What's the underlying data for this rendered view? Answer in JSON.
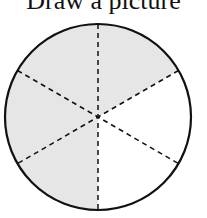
{
  "title": "Draw a picture",
  "diagram": {
    "type": "fraction-circle",
    "total_parts": 6,
    "shaded_parts": 4,
    "shaded_color": "#e6e6e6",
    "line_color": "#111111"
  }
}
